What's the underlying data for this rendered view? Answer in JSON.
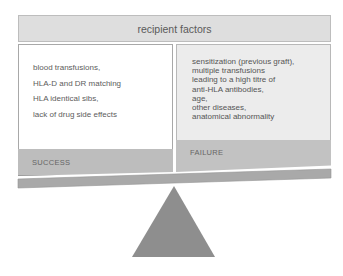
{
  "header": {
    "title": "recipient factors"
  },
  "success_panel": {
    "label": "SUCCESS",
    "factors": [
      "blood transfusions,",
      "HLA-D and DR matching",
      "HLA identical sibs,",
      "lack of drug side effects"
    ]
  },
  "failure_panel": {
    "label": "FAILURE",
    "factors": [
      "sensitization (previous graft),",
      "multiple transfusions",
      "leading to a high titre of",
      "anti-HLA antibodies,",
      "age,",
      "other diseases,",
      "anatomical abnormality"
    ]
  },
  "colors": {
    "header_bg": "#dedede",
    "band_gray": "#bdbdbd",
    "beam": "#a9a9a9",
    "fulcrum": "#8e8e8e"
  }
}
